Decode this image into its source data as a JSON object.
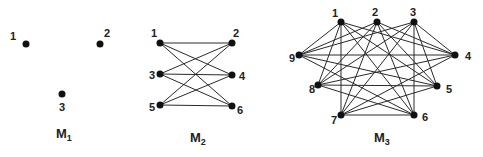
{
  "graphs": [
    {
      "title": "M",
      "subscript": "1",
      "title_pos": [
        56,
        138
      ],
      "nodes": [
        {
          "id": "1",
          "x": 26,
          "y": 44,
          "lx": 10,
          "ly": 40
        },
        {
          "id": "2",
          "x": 100,
          "y": 44,
          "lx": 104,
          "ly": 37
        },
        {
          "id": "3",
          "x": 62,
          "y": 94,
          "lx": 59,
          "ly": 111
        }
      ],
      "edges": []
    },
    {
      "title": "M",
      "subscript": "2",
      "title_pos": [
        190,
        142
      ],
      "nodes": [
        {
          "id": "1",
          "x": 160,
          "y": 43,
          "lx": 151,
          "ly": 37
        },
        {
          "id": "2",
          "x": 232,
          "y": 43,
          "lx": 233,
          "ly": 37
        },
        {
          "id": "3",
          "x": 160,
          "y": 74,
          "lx": 149,
          "ly": 79
        },
        {
          "id": "4",
          "x": 232,
          "y": 75,
          "lx": 239,
          "ly": 80
        },
        {
          "id": "5",
          "x": 160,
          "y": 105,
          "lx": 149,
          "ly": 111
        },
        {
          "id": "6",
          "x": 232,
          "y": 106,
          "lx": 237,
          "ly": 114
        }
      ],
      "edges": [
        [
          "1",
          "2"
        ],
        [
          "1",
          "4"
        ],
        [
          "1",
          "6"
        ],
        [
          "3",
          "2"
        ],
        [
          "3",
          "4"
        ],
        [
          "3",
          "6"
        ],
        [
          "5",
          "2"
        ],
        [
          "5",
          "4"
        ],
        [
          "5",
          "6"
        ]
      ]
    },
    {
      "title": "M",
      "subscript": "3",
      "title_pos": [
        374,
        142
      ],
      "nodes": [
        {
          "id": "1",
          "x": 341,
          "y": 22,
          "lx": 332,
          "ly": 17
        },
        {
          "id": "2",
          "x": 377,
          "y": 22,
          "lx": 372,
          "ly": 16
        },
        {
          "id": "3",
          "x": 414,
          "y": 22,
          "lx": 410,
          "ly": 16
        },
        {
          "id": "4",
          "x": 455,
          "y": 55,
          "lx": 465,
          "ly": 60
        },
        {
          "id": "5",
          "x": 437,
          "y": 86,
          "lx": 446,
          "ly": 93
        },
        {
          "id": "6",
          "x": 414,
          "y": 115,
          "lx": 422,
          "ly": 121
        },
        {
          "id": "7",
          "x": 341,
          "y": 115,
          "lx": 331,
          "ly": 124
        },
        {
          "id": "8",
          "x": 318,
          "y": 85,
          "lx": 309,
          "ly": 93
        },
        {
          "id": "9",
          "x": 299,
          "y": 55,
          "lx": 289,
          "ly": 62
        }
      ],
      "partition": [
        [
          "1",
          "2",
          "3"
        ],
        [
          "4",
          "5",
          "6"
        ],
        [
          "7",
          "8",
          "9"
        ]
      ],
      "edges": [
        [
          "1",
          "4"
        ],
        [
          "1",
          "5"
        ],
        [
          "1",
          "6"
        ],
        [
          "1",
          "7"
        ],
        [
          "1",
          "8"
        ],
        [
          "1",
          "9"
        ],
        [
          "2",
          "4"
        ],
        [
          "2",
          "5"
        ],
        [
          "2",
          "6"
        ],
        [
          "2",
          "7"
        ],
        [
          "2",
          "8"
        ],
        [
          "2",
          "9"
        ],
        [
          "3",
          "4"
        ],
        [
          "3",
          "5"
        ],
        [
          "3",
          "6"
        ],
        [
          "3",
          "7"
        ],
        [
          "3",
          "8"
        ],
        [
          "3",
          "9"
        ],
        [
          "4",
          "7"
        ],
        [
          "4",
          "8"
        ],
        [
          "4",
          "9"
        ],
        [
          "5",
          "7"
        ],
        [
          "5",
          "8"
        ],
        [
          "5",
          "9"
        ],
        [
          "6",
          "7"
        ],
        [
          "6",
          "8"
        ],
        [
          "6",
          "9"
        ]
      ]
    }
  ]
}
